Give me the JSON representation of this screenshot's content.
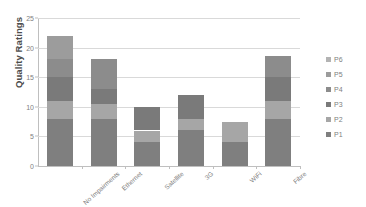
{
  "chart_data": {
    "type": "bar",
    "stacked": true,
    "title": "",
    "xlabel": "",
    "ylabel": "Quality Ratings",
    "ylim": [
      0,
      25
    ],
    "y_ticks": [
      0,
      5,
      10,
      15,
      20,
      25
    ],
    "grid": true,
    "legend_position": "right",
    "categories": [
      "No Impairments",
      "Ethernet",
      "Satellite",
      "3G",
      "WiFi",
      "Fibre"
    ],
    "series": [
      {
        "name": "P1",
        "color": "#7f7f7f",
        "values": [
          8,
          8,
          4,
          6,
          4,
          8
        ]
      },
      {
        "name": "P2",
        "color": "#a6a6a6",
        "values": [
          3,
          2.5,
          2,
          2,
          3.5,
          3
        ]
      },
      {
        "name": "P3",
        "color": "#7a7a7a",
        "values": [
          4,
          2.5,
          4,
          4,
          0,
          4
        ]
      },
      {
        "name": "P4",
        "color": "#8c8c8c",
        "values": [
          3,
          5,
          0,
          0,
          0,
          3.5
        ]
      },
      {
        "name": "P5",
        "color": "#9c9c9c",
        "values": [
          4,
          0,
          0,
          0,
          0,
          0
        ]
      },
      {
        "name": "P6",
        "color": "#b3b3b3",
        "values": [
          0,
          0,
          0,
          0,
          0,
          0
        ]
      }
    ],
    "totals": [
      22,
      18,
      10,
      12,
      7.5,
      18.5
    ]
  },
  "legend": {
    "items": [
      {
        "label": "P6",
        "color": "#b3b3b3"
      },
      {
        "label": "P5",
        "color": "#9c9c9c"
      },
      {
        "label": "P4",
        "color": "#8c8c8c"
      },
      {
        "label": "P3",
        "color": "#7a7a7a"
      },
      {
        "label": "P2",
        "color": "#a6a6a6"
      },
      {
        "label": "P1",
        "color": "#7f7f7f"
      }
    ]
  },
  "colors": {
    "gridline": "#d9d9d9",
    "axis": "#bfbfbf",
    "tick_text": "#808080",
    "axis_title": "#4d4d4d",
    "background": "#ffffff"
  }
}
